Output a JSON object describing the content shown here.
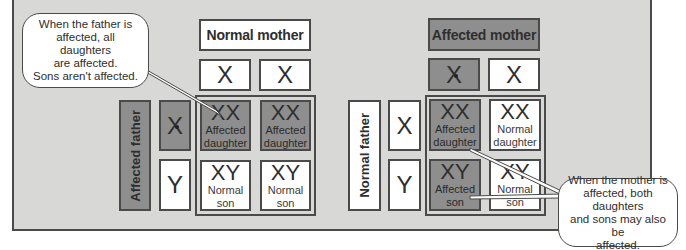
{
  "left_cross": {
    "mother_header": "Normal mother",
    "father_label": "Affected father",
    "mother_alleles": [
      "X",
      "X"
    ],
    "father_alleles": [
      "X",
      "Y"
    ],
    "cells": [
      {
        "genotype": "XX",
        "label_line1": "Affected",
        "label_line2": "daughter",
        "status": "affected"
      },
      {
        "genotype": "XX",
        "label_line1": "Affected",
        "label_line2": "daughter",
        "status": "affected"
      },
      {
        "genotype": "XY",
        "label_line1": "Normal",
        "label_line2": "son",
        "status": "normal"
      },
      {
        "genotype": "XY",
        "label_line1": "Normal",
        "label_line2": "son",
        "status": "normal"
      }
    ],
    "callout": {
      "line1": "When the father is",
      "line2": "affected, all daughters",
      "line3": "are affected.",
      "line4": "Sons aren't affected."
    }
  },
  "right_cross": {
    "mother_header": "Affected mother",
    "father_label": "Normal father",
    "mother_alleles": [
      "X",
      "X"
    ],
    "father_alleles": [
      "X",
      "Y"
    ],
    "cells": [
      {
        "genotype": "XX",
        "label_line1": "Affected",
        "label_line2": "daughter",
        "status": "affected"
      },
      {
        "genotype": "XX",
        "label_line1": "Normal",
        "label_line2": "daughter",
        "status": "normal"
      },
      {
        "genotype": "XY",
        "label_line1": "Affected",
        "label_line2": "son",
        "status": "affected"
      },
      {
        "genotype": "XY",
        "label_line1": "Normal",
        "label_line2": "son",
        "status": "normal"
      }
    ],
    "callout": {
      "line1": "When the mother is",
      "line2": "affected, both daughters",
      "line3": "and sons may also be",
      "line4": "affected."
    }
  },
  "colors": {
    "panel_bg": "#d8d8d6",
    "affected_fill": "#8e8e8e",
    "normal_fill": "#ffffff",
    "border": "#4a4a4a"
  }
}
